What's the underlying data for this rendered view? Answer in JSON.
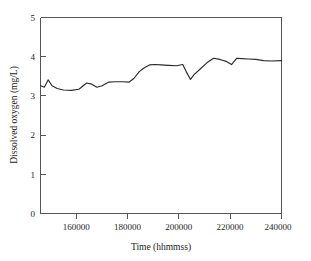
{
  "chart_data": {
    "type": "line",
    "title": "",
    "xlabel": "Time (hhmmss)",
    "ylabel": "Dissolved oxygen (mg/L)",
    "xlim": [
      146000,
      240000
    ],
    "ylim": [
      0,
      5
    ],
    "xticks": [
      160000,
      180000,
      200000,
      220000,
      240000
    ],
    "xtick_labels": [
      "160000",
      "180000",
      "200000",
      "220000",
      "240000"
    ],
    "yticks": [
      0,
      1,
      2,
      3,
      4,
      5
    ],
    "ytick_labels": [
      "0",
      "1",
      "2",
      "3",
      "4",
      "5"
    ],
    "grid": false,
    "legend": false,
    "line_color": "#2b2b2b",
    "series": [
      {
        "name": "Dissolved oxygen",
        "x": [
          146000,
          147500,
          149000,
          150500,
          152500,
          155000,
          158000,
          161000,
          164000,
          166000,
          168000,
          170000,
          172500,
          175000,
          178000,
          180500,
          182500,
          184500,
          186500,
          188500,
          190500,
          193000,
          196000,
          199000,
          201500,
          203000,
          204500,
          206000,
          208500,
          211000,
          213500,
          216000,
          218500,
          220500,
          222500,
          224500,
          227000,
          230000,
          233000,
          236000,
          240000
        ],
        "y": [
          3.26,
          3.22,
          3.41,
          3.26,
          3.19,
          3.15,
          3.14,
          3.17,
          3.33,
          3.3,
          3.22,
          3.26,
          3.35,
          3.36,
          3.36,
          3.35,
          3.45,
          3.62,
          3.72,
          3.79,
          3.8,
          3.79,
          3.78,
          3.77,
          3.8,
          3.6,
          3.42,
          3.55,
          3.7,
          3.85,
          3.96,
          3.93,
          3.88,
          3.8,
          3.96,
          3.95,
          3.94,
          3.93,
          3.9,
          3.89,
          3.9
        ]
      }
    ]
  },
  "axis_labels": {
    "x_title": "Time (hhmmss)",
    "y_title": "Dissolved oxygen (mg/L)"
  }
}
